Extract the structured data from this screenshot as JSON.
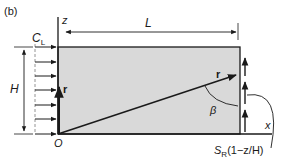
{
  "figure": {
    "panel_label": "(b)",
    "axis_z_label": "z",
    "axis_x_label": "x",
    "origin_label": "O",
    "length_label": "L",
    "height_label": "H",
    "left_boundary_label_main": "C",
    "left_boundary_label_sub": "L",
    "vector_label_left": "r",
    "vector_label_diag": "r",
    "angle_label": "β",
    "right_boundary_label_main": "S",
    "right_boundary_label_sub": "R",
    "right_boundary_label_expr": "(1−z/H)"
  },
  "colors": {
    "fill": "#d9d9d9",
    "stroke": "#1a1a1a",
    "dashed": "#888888"
  },
  "left_arrows_y": [
    47,
    62,
    76,
    90,
    105,
    119,
    134
  ],
  "right_arrows": [
    {
      "y_base": 132,
      "y_tip": 108
    },
    {
      "y_base": 104,
      "y_tip": 80
    },
    {
      "y_base": 76,
      "y_tip": 56
    }
  ]
}
